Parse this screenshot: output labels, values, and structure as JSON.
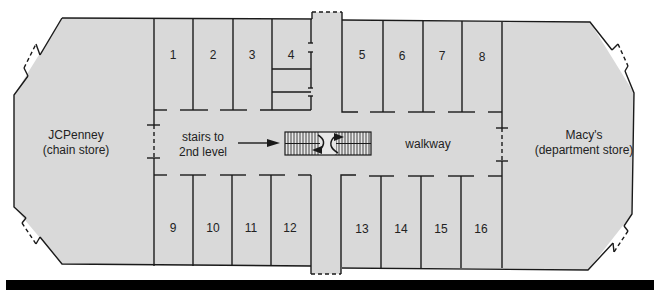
{
  "diagram": {
    "colors": {
      "floor": "#d9d9d9",
      "walls": "#1a1a1a",
      "footer_bar": "#000000"
    },
    "anchors": {
      "left": {
        "name": "JCPenney",
        "type": "(chain store)"
      },
      "right": {
        "name": "Macy's",
        "type": "(department store)"
      }
    },
    "stairs_label_line1": "stairs to",
    "stairs_label_line2": "2nd level",
    "walkway_label": "walkway",
    "stores_top": [
      "1",
      "2",
      "3",
      "4",
      "5",
      "6",
      "7",
      "8"
    ],
    "stores_bottom": [
      "9",
      "10",
      "11",
      "12",
      "13",
      "14",
      "15",
      "16"
    ]
  }
}
